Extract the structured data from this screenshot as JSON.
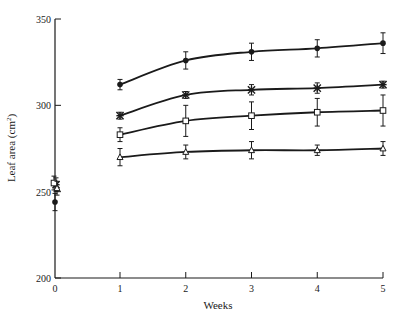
{
  "chart_data": {
    "type": "line",
    "title": "",
    "xlabel": "Weeks",
    "ylabel": "Leaf area (cm²)",
    "ylabel_main": "Leaf area (cm",
    "ylabel_sup": "2",
    "ylabel_close": ")",
    "xlim": [
      0,
      5
    ],
    "ylim": [
      200,
      350
    ],
    "x_ticks": [
      0,
      1,
      2,
      3,
      4,
      5
    ],
    "y_ticks": [
      200,
      250,
      300,
      350
    ],
    "grid": false,
    "legend": "none",
    "x": [
      0,
      1,
      2,
      3,
      4,
      5
    ],
    "series": [
      {
        "name": "filled-circle",
        "marker": "filled-circle",
        "values": [
          244,
          312,
          326,
          331,
          333,
          336
        ],
        "errors": [
          5,
          3,
          5,
          5,
          5,
          6
        ],
        "curve_from": 1
      },
      {
        "name": "star",
        "marker": "star",
        "values": [
          254,
          294,
          306,
          309,
          310,
          312
        ],
        "errors": [
          4,
          2,
          2,
          3,
          3,
          2
        ],
        "curve_from": 1
      },
      {
        "name": "open-square",
        "marker": "open-square",
        "values": [
          255,
          283,
          291,
          294,
          296,
          297
        ],
        "errors": [
          4,
          4,
          9,
          8,
          8,
          9
        ],
        "curve_from": 1
      },
      {
        "name": "open-triangle",
        "marker": "open-triangle",
        "values": [
          252,
          270,
          273,
          274,
          274,
          275
        ],
        "errors": [
          4,
          5,
          4,
          5,
          3,
          4
        ],
        "curve_from": 1
      }
    ]
  },
  "colors": {
    "ink": "#1a1a1a",
    "background": "#ffffff"
  }
}
